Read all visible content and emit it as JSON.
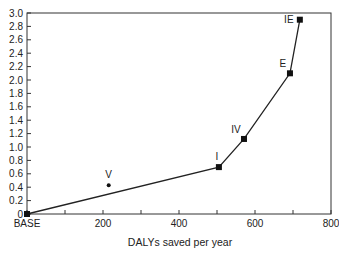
{
  "chart_data": {
    "type": "line",
    "title": "",
    "xlabel": "DALYs saved per year",
    "ylabel": "",
    "xlim": [
      0,
      800
    ],
    "ylim": [
      0,
      3.0
    ],
    "grid": false,
    "legend": null,
    "x_ticks": [
      0,
      100,
      200,
      300,
      400,
      500,
      600,
      700,
      800
    ],
    "x_tick_labels": [
      "BASE",
      "",
      "200",
      "",
      "400",
      "",
      "600",
      "",
      "800"
    ],
    "y_ticks": [
      0,
      0.2,
      0.4,
      0.6,
      0.8,
      1.0,
      1.2,
      1.4,
      1.6,
      1.8,
      2.0,
      2.2,
      2.4,
      2.6,
      2.8,
      3.0
    ],
    "y_tick_labels": [
      "0",
      "0.2",
      "0.4",
      "0.6",
      "0.8",
      "1.0",
      "1.2",
      "1.4",
      "1.6",
      "1.8",
      "2.0",
      "2.2",
      "2.4",
      "2.6",
      "2.8",
      "3.0"
    ],
    "series": [
      {
        "name": "efficiency frontier",
        "style": "line-with-square-markers",
        "points": [
          {
            "label": "BASE",
            "x": 0,
            "y": 0
          },
          {
            "label": "I",
            "x": 505,
            "y": 0.7
          },
          {
            "label": "IV",
            "x": 571,
            "y": 1.12
          },
          {
            "label": "E",
            "x": 692,
            "y": 2.1
          },
          {
            "label": "IE",
            "x": 718,
            "y": 2.9
          }
        ]
      },
      {
        "name": "dominated",
        "style": "dot-marker",
        "points": [
          {
            "label": "V",
            "x": 215,
            "y": 0.43
          }
        ]
      }
    ]
  }
}
